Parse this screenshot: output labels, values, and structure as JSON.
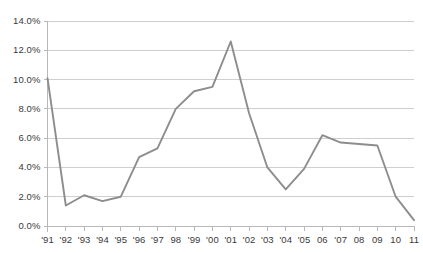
{
  "chart_data": {
    "type": "line",
    "title": "",
    "subtitle": "",
    "xlabel": "",
    "ylabel": "",
    "categories": [
      "'91",
      "'92",
      "'93",
      "'94",
      "'95",
      "'96",
      "'97",
      "98",
      "'99",
      "'00",
      "'01",
      "'02",
      "'03",
      "'04",
      "'05",
      "06",
      "'07",
      "08",
      "09",
      "10",
      "11"
    ],
    "values": [
      10.1,
      1.4,
      2.1,
      1.7,
      2.0,
      4.7,
      5.3,
      8.0,
      9.2,
      9.5,
      12.6,
      7.7,
      4.0,
      2.5,
      3.9,
      6.2,
      5.7,
      5.6,
      5.5,
      2.0,
      0.4
    ],
    "ytick_labels": [
      "14.0%",
      "12.0%",
      "10.0%",
      "8.0%",
      "6.0%",
      "4.0%",
      "2.0%",
      "0.0%"
    ],
    "ytick_values": [
      14,
      12,
      10,
      8,
      6,
      4,
      2,
      0
    ],
    "ylim": [
      0,
      14
    ],
    "yunit": "%",
    "grid": true,
    "legend": "none",
    "series_color": "#8d8d8d",
    "grid_color": "#cfcfcf",
    "axis_color": "#b8b8b8",
    "text_color": "#3a3a3a"
  }
}
